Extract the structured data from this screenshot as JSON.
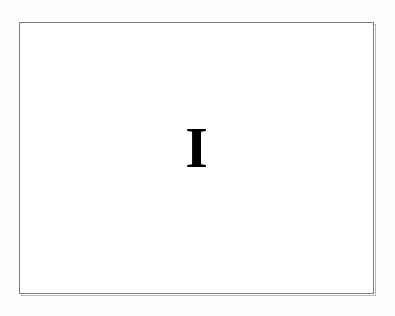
{
  "document": {
    "page_background_color": "#fefefe",
    "frame": {
      "name": "content-frame",
      "border_color": "#7e7e7e",
      "shadow_border_color": "#b9b9b9",
      "fill_color": "#ffffff"
    },
    "content": {
      "folio_text": "I",
      "folio_color": "#000000",
      "alignment": "center"
    }
  }
}
